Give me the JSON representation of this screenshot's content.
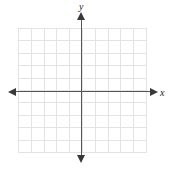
{
  "figure": {
    "name": "cartesian-coordinate-plane",
    "width": 174,
    "height": 171,
    "background_color": "#ffffff"
  },
  "axes": {
    "x_label": "x",
    "y_label": "y",
    "axis_color": "#555558",
    "arrow_color": "#39393c",
    "origin": {
      "x": 82,
      "y": 92
    },
    "arrows": {
      "x_right": "arrow-right",
      "x_left": "arrow-left",
      "y_up": "arrow-up",
      "y_down": "arrow-down"
    }
  },
  "grid": {
    "color": "#e3e3e6",
    "columns": 10,
    "rows": 10,
    "cell_width": 12.8,
    "cell_height": 12.4,
    "left": 18,
    "top": 28,
    "width": 128,
    "height": 124,
    "tick_labels_visible": false
  },
  "chart_data": {
    "type": "scatter",
    "title": "",
    "xlabel": "x",
    "ylabel": "y",
    "xlim": [
      -5,
      5
    ],
    "ylim": [
      -5,
      5
    ],
    "xticks": [
      -5,
      -4,
      -3,
      -2,
      -1,
      0,
      1,
      2,
      3,
      4,
      5
    ],
    "yticks": [
      -5,
      -4,
      -3,
      -2,
      -1,
      0,
      1,
      2,
      3,
      4,
      5
    ],
    "xtick_labels": [],
    "ytick_labels": [],
    "grid": true,
    "legend": null,
    "series": [],
    "annotations": []
  }
}
